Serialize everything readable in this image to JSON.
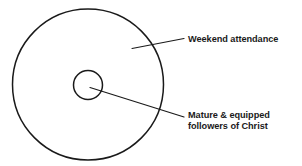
{
  "diagram": {
    "type": "concentric-circles",
    "background_color": "#ffffff",
    "stroke_color": "#1a1a1a",
    "text_color": "#1a1a1a",
    "width": 302,
    "height": 166,
    "shapes": {
      "outer_circle": {
        "name": "outer-circle",
        "cx": 88,
        "cy": 84.5,
        "r": 75.5,
        "stroke_width": 1.5,
        "fill": "none"
      },
      "inner_circle": {
        "name": "inner-circle",
        "cx": 88,
        "cy": 85,
        "r": 14.5,
        "stroke_width": 1.5,
        "fill": "none"
      }
    },
    "leader_lines": [
      {
        "name": "leader-line-weekend-attendance",
        "x1": 132,
        "y1": 48.5,
        "x2": 184,
        "y2": 38.5,
        "stroke_width": 1.2
      },
      {
        "name": "leader-line-mature-followers",
        "x1": 90,
        "y1": 87.5,
        "x2": 184,
        "y2": 117,
        "stroke_width": 1.2
      }
    ],
    "labels": {
      "weekend_attendance": {
        "text": "Weekend attendance"
      },
      "mature_followers": {
        "line1": "Mature & equipped",
        "line2": "followers of Christ"
      }
    }
  }
}
